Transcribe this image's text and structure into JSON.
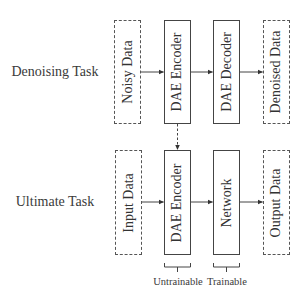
{
  "diagram": {
    "rows": [
      {
        "label": "Denoising Task",
        "nodes": [
          {
            "id": "noisy-data",
            "label": "Noisy Data",
            "style": "dashed"
          },
          {
            "id": "dae-encoder-top",
            "label": "DAE Encoder",
            "style": "solid"
          },
          {
            "id": "dae-decoder",
            "label": "DAE Decoder",
            "style": "solid"
          },
          {
            "id": "denoised-data",
            "label": "Denoised Data",
            "style": "dashed"
          }
        ]
      },
      {
        "label": "Ultimate Task",
        "nodes": [
          {
            "id": "input-data",
            "label": "Input Data",
            "style": "dashed"
          },
          {
            "id": "dae-encoder-bottom",
            "label": "DAE Encoder",
            "style": "solid"
          },
          {
            "id": "network",
            "label": "Network",
            "style": "solid"
          },
          {
            "id": "output-data",
            "label": "Output Data",
            "style": "dashed"
          }
        ]
      }
    ],
    "edges": [
      {
        "from": "noisy-data",
        "to": "dae-encoder-top",
        "style": "solid"
      },
      {
        "from": "dae-encoder-top",
        "to": "dae-decoder",
        "style": "solid"
      },
      {
        "from": "dae-decoder",
        "to": "denoised-data",
        "style": "solid"
      },
      {
        "from": "dae-encoder-top",
        "to": "dae-encoder-bottom",
        "style": "dashed"
      },
      {
        "from": "input-data",
        "to": "dae-encoder-bottom",
        "style": "solid"
      },
      {
        "from": "dae-encoder-bottom",
        "to": "network",
        "style": "solid"
      },
      {
        "from": "network",
        "to": "output-data",
        "style": "solid"
      }
    ],
    "braces": [
      {
        "target": "dae-encoder-bottom",
        "label": "Untrainable"
      },
      {
        "target": "network",
        "label": "Trainable"
      }
    ],
    "colors": {
      "stroke": "#444444",
      "text": "#333333",
      "background": "#ffffff"
    }
  }
}
